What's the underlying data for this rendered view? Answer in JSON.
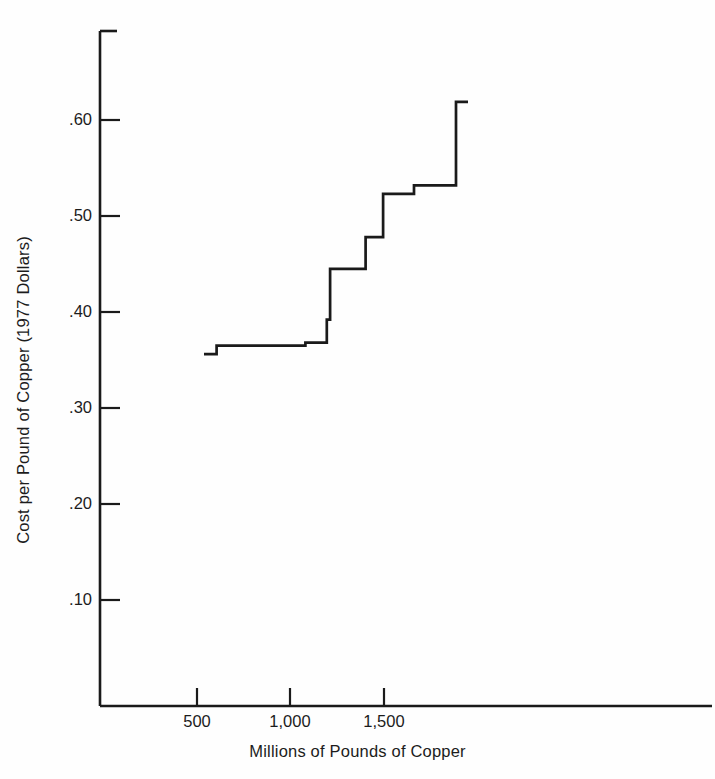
{
  "chart_data": {
    "type": "line",
    "subtype": "step",
    "title": "",
    "xlabel": "Millions of Pounds of Copper",
    "ylabel": "Cost per Pound of Copper (1977 Dollars)",
    "xlim": [
      0,
      1620
    ],
    "ylim": [
      0,
      0.695
    ],
    "xticks": [
      500,
      1000,
      1500
    ],
    "xtick_labels": [
      "500",
      "1,000",
      "1,500"
    ],
    "yticks": [
      0.1,
      0.2,
      0.3,
      0.4,
      0.5,
      0.6
    ],
    "ytick_labels": [
      ".10",
      ".20",
      ".30",
      ".40",
      ".50",
      ".60"
    ],
    "grid": false,
    "legend": null,
    "line_color": "#1a1a1a",
    "line_width": 2.6,
    "series": [
      {
        "name": "Copper supply cost curve",
        "step": "post",
        "x": [
          0,
          68,
          68,
          545,
          545,
          660,
          660,
          678,
          678,
          869,
          869,
          963,
          963,
          1129,
          1129,
          1355,
          1355
        ],
        "y": [
          0.356,
          0.356,
          0.365,
          0.365,
          0.368,
          0.368,
          0.392,
          0.392,
          0.445,
          0.445,
          0.478,
          0.478,
          0.523,
          0.523,
          0.532,
          0.532,
          0.619
        ]
      }
    ],
    "steps": [
      {
        "x_start": 0,
        "x_end": 68,
        "cost": 0.356
      },
      {
        "x_start": 68,
        "x_end": 545,
        "cost": 0.365
      },
      {
        "x_start": 545,
        "x_end": 660,
        "cost": 0.368
      },
      {
        "x_start": 660,
        "x_end": 678,
        "cost": 0.392
      },
      {
        "x_start": 678,
        "x_end": 869,
        "cost": 0.445
      },
      {
        "x_start": 869,
        "x_end": 963,
        "cost": 0.478
      },
      {
        "x_start": 963,
        "x_end": 1129,
        "cost": 0.523
      },
      {
        "x_start": 1129,
        "x_end": 1355,
        "cost": 0.532
      },
      {
        "x_start": 1355,
        "x_end": 1355,
        "cost": 0.619
      }
    ]
  }
}
